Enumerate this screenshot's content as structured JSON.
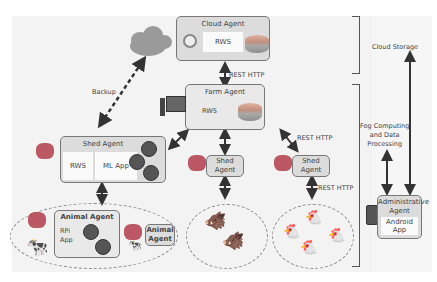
{
  "cloud_agent": {
    "title": "Cloud Agent",
    "rws": "RWS"
  },
  "farm_agent": {
    "title": "Farm Agent",
    "rws": "RWS"
  },
  "shed_agent_main": {
    "title": "Shed Agent",
    "rws": "RWS",
    "ml": "ML App",
    "sensors": [
      "Humidity",
      "Camera",
      "Temp"
    ]
  },
  "shed_agent_2": {
    "title": "Shed\nAgent"
  },
  "shed_agent_3": {
    "title": "Shed\nAgent"
  },
  "animal_agent_main": {
    "title": "Animal Agent",
    "rpi": "RPi\nApp",
    "sensors": [
      "GPS",
      "Accel"
    ]
  },
  "animal_agent_2": {
    "title": "Animal\nAgent"
  },
  "admin_agent": {
    "title": "Administrative\nAgent",
    "app": "Android\nApp"
  },
  "labels": {
    "rest_http_1": "REST HTTP",
    "rest_http_2": "REST HTTP",
    "rest_http_3": "REST HTTP",
    "backup": "Backup",
    "cloud_storage": "Cloud Storage",
    "fog": "Fog Computing\nand Data\nProcessing"
  }
}
